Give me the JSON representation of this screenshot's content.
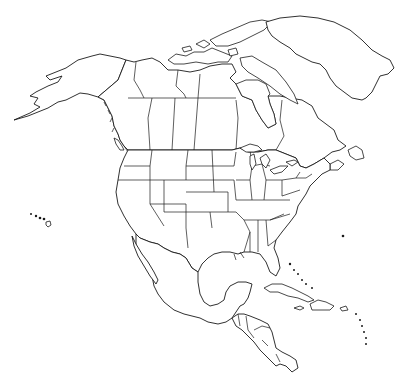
{
  "map": {
    "type": "outline-map",
    "region": "North America",
    "style": "black outlines on white, no labels",
    "colors": {
      "background": "#ffffff",
      "outline": "#1a1a1a"
    },
    "regions_shown": [
      "Alaska",
      "Canada",
      "Greenland",
      "Contiguous United States",
      "Hawaii",
      "Mexico",
      "Central America",
      "Caribbean islands"
    ],
    "labels": []
  }
}
